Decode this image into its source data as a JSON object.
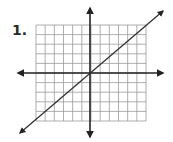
{
  "problem": {
    "number_label": "1."
  },
  "chart_data": {
    "type": "line",
    "title": "",
    "xlabel": "",
    "ylabel": "",
    "grid": true,
    "grid_cells": {
      "columns": 12,
      "rows": 10
    },
    "xlim": [
      -6,
      6
    ],
    "ylim": [
      -5,
      5
    ],
    "axes_arrows": true,
    "series": [
      {
        "name": "line",
        "equation": "y = x",
        "slope": 1,
        "intercept": 0,
        "x": [
          -7,
          7
        ],
        "y": [
          -7,
          7
        ],
        "arrows_both_ends": true
      }
    ]
  },
  "colors": {
    "grid": "#9a9a9a",
    "axis": "#222222",
    "line": "#333333",
    "text": "#2a2a2a"
  }
}
